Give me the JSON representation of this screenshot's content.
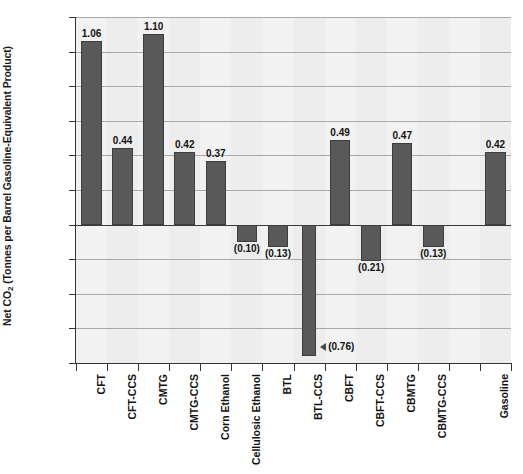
{
  "chart_data": {
    "type": "bar",
    "title": "",
    "xlabel": "",
    "ylabel": "Net CO2 (Tonnes per Barrel Gasoline-Equivalent Product)",
    "ylabel_prefix": "Net CO",
    "ylabel_sub": "2",
    "ylabel_suffix": " (Tonnes per Barrel Gasoline-Equivalent Product)",
    "ylim": [
      -0.8,
      1.2
    ],
    "ytick_values": [
      1.2,
      1.0,
      0.8,
      0.6,
      0.4,
      0.2,
      0.0,
      -0.2,
      -0.4,
      -0.6,
      -0.8
    ],
    "ytick_labels": [
      "1.20",
      "1.00",
      "0.80",
      "0.60",
      "0.40",
      "0.20",
      "0.00",
      "(0.20)",
      "(0.40)",
      "(0.60)",
      "(0.80)"
    ],
    "grid": true,
    "legend": "none",
    "negative_format": "parentheses",
    "bar_color": "#595959",
    "categories": [
      "CFT",
      "CFT-CCS",
      "CMTG",
      "CMTG-CCS",
      "Corn Ethanol",
      "Cellulosic Ethanol",
      "BTL",
      "BTL-CCS",
      "CBFT",
      "CBFT-CCS",
      "CBMTG",
      "CBMTG-CCS",
      "",
      "Gasoline"
    ],
    "values": [
      1.06,
      0.44,
      1.1,
      0.42,
      0.37,
      -0.1,
      -0.13,
      -0.76,
      0.49,
      -0.21,
      0.47,
      -0.13,
      null,
      0.42
    ],
    "value_labels": [
      "1.06",
      "0.44",
      "1.10",
      "0.42",
      "0.37",
      "(0.10)",
      "(0.13)",
      "(0.76)",
      "0.49",
      "(0.21)",
      "0.47",
      "(0.13)",
      "",
      "0.42"
    ],
    "annotations": [
      {
        "label": "(0.76)",
        "marker": "left-triangle",
        "target_category": "BTL-CCS"
      }
    ]
  },
  "caption": ""
}
